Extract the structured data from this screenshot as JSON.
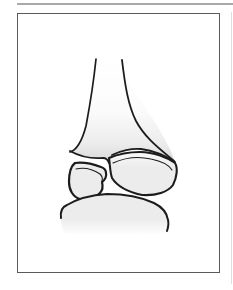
{
  "palette": {
    "background": "#ffffff",
    "top_rule": "#a9a9a9",
    "frame_border": "#5a5a5a",
    "page_edge": "#dedede",
    "outline": "#1c1c1c",
    "bone_light": "#fbfbfb",
    "bone_mid": "#ececec",
    "bone_shade": "#d7d7d7",
    "white": "#ffffff"
  },
  "figure": {
    "shapes": [
      {
        "name": "tibia-shaft-body",
        "d": "M96,59 C93,88 89,110 86,126 C82,141 76,150 71,152 C80,156 92,159 103,158 C107,157 109,159 110,162 C112,157 118,152 126,150 C134,148 144,148 152,151 C162,154 170,158 175,162 C172,152 166,141 159,129 C148,109 126,86 122,60 Z",
        "fill": "shaft-gradient",
        "stroke": "none",
        "stroke_width": 0
      },
      {
        "name": "tibia-shaft-left-outline",
        "d": "M96,59 C93,88 89,110 86,126 C82,141 77,150 70,152",
        "fill": "none",
        "stroke": "outline",
        "stroke_width": 1.7
      },
      {
        "name": "tibia-shaft-right-outline",
        "d": "M122,60 C125,85 128,105 136,121 C145,138 160,149 174,161",
        "fill": "none",
        "stroke": "outline",
        "stroke_width": 1.8
      },
      {
        "name": "metaphysis-bottom-left-outline",
        "d": "M70,151 C79,156 91,159 103,158 C106,158 108,160 109,163",
        "fill": "none",
        "stroke": "outline",
        "stroke_width": 1.8
      },
      {
        "name": "metaphysis-bottom-right-outline",
        "d": "M112,155 C120,151 132,148 141,149 C155,151 166,156 175,162",
        "fill": "none",
        "stroke": "outline",
        "stroke_width": 1.8
      },
      {
        "name": "epiphysis-main-fragment",
        "d": "M109,158 C110,165 110,172 112,178 C117,186 128,192 142,195 C156,196 168,192 173,185 C177,177 178,168 175,163 C168,158 154,152 140,152 C127,152 116,155 109,158 Z",
        "fill": "bone-gradient",
        "stroke": "outline",
        "stroke_width": 2.1
      },
      {
        "name": "epiphysis-subchondral-line",
        "d": "M113,163 C124,158 138,156 151,159 C161,161 169,165 172,170",
        "fill": "none",
        "stroke": "outline",
        "stroke_width": 1.1
      },
      {
        "name": "avulsed-fragment",
        "d": "M75,163 C83,162 93,164 101,167 C104,168 106,170 106,173 C107,176 105,180 102,182 C103,186 103,190 100,193 C95,198 87,200 80,199 C73,197 69,190 69,182 C69,174 71,166 75,163 Z",
        "fill": "bone-gradient",
        "stroke": "outline",
        "stroke_width": 2.2
      },
      {
        "name": "avulsed-fragment-subchondral-line",
        "d": "M76,169 C85,167 94,170 100,174 C102,176 103,178 102,181",
        "fill": "none",
        "stroke": "outline",
        "stroke_width": 1.1
      },
      {
        "name": "talus-body",
        "d": "M61,217 C60,211 62,207 66,205 C76,199 92,195 107,194 C123,194 142,197 155,203 C163,207 168,213 169,221 C169,226 168,230 166,233 C130,236 95,236 64,233 C62,228 61,222 61,217 Z",
        "fill": "talus-gradient",
        "stroke": "none",
        "stroke_width": 0
      },
      {
        "name": "talus-dome-outline",
        "d": "M61,218 C60,211 62,207 67,205 C77,199 92,195 107,194 C123,194 141,197 154,203 C162,207 167,212 168,220 C169,224 168,228 167,231",
        "fill": "none",
        "stroke": "outline",
        "stroke_width": 2
      }
    ]
  }
}
